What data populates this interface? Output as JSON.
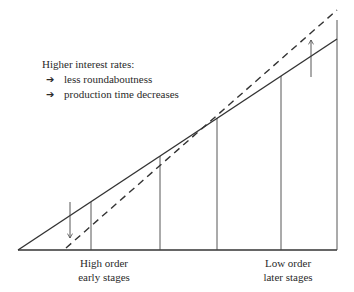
{
  "annotation": {
    "heading": "Higher interest rates:",
    "bullets": [
      {
        "icon": "arrow-right-icon",
        "glyph": "➔",
        "text": "less roundaboutness"
      },
      {
        "icon": "arrow-right-icon",
        "glyph": "➔",
        "text": "production time decreases"
      }
    ]
  },
  "labels": {
    "left": {
      "line1": "High order",
      "line2": "early stages"
    },
    "right": {
      "line1": "Low order",
      "line2": "later stages"
    }
  },
  "diagram": {
    "baseline": {
      "x1": 18,
      "y1": 250,
      "x2": 337,
      "y2": 250
    },
    "solid_line": {
      "x1": 18,
      "y1": 250,
      "x2": 337,
      "y2": 39
    },
    "dashed_line": {
      "x1": 66,
      "y1": 248,
      "x2": 337,
      "y2": 10
    },
    "verticals_x": [
      91,
      160,
      217,
      281,
      337
    ],
    "down_arrow": {
      "x": 70,
      "y1": 202,
      "y2": 238
    },
    "up_arrow": {
      "x": 311,
      "y1": 77,
      "y2": 39
    },
    "colors": {
      "line": "#333333",
      "thin": "#444444"
    }
  }
}
